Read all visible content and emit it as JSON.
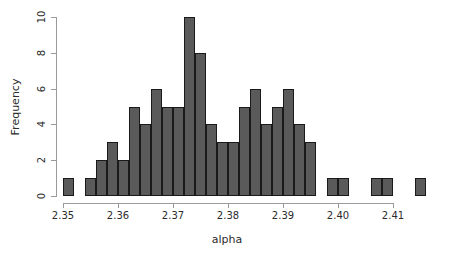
{
  "chart_data": {
    "type": "bar",
    "subtype": "histogram",
    "title": "",
    "xlabel": "alpha",
    "ylabel": "Frequency",
    "xlim": [
      2.3495,
      2.4165
    ],
    "ylim": [
      0,
      10
    ],
    "bin_width": 0.002,
    "grid": false,
    "legend": null,
    "xticks": [
      2.35,
      2.36,
      2.37,
      2.38,
      2.39,
      2.4,
      2.41
    ],
    "xtick_labels": [
      "2.35",
      "2.36",
      "2.37",
      "2.38",
      "2.39",
      "2.40",
      "2.41"
    ],
    "yticks": [
      0,
      2,
      4,
      6,
      8,
      10
    ],
    "ytick_labels": [
      "0",
      "2",
      "4",
      "6",
      "8",
      "10"
    ],
    "bar_fill": "#5a5a5a",
    "bar_edge": "#1a1a1a",
    "axis_color": "#9a9a9a",
    "bins": [
      {
        "x0": 2.35,
        "x1": 2.352,
        "count": 1
      },
      {
        "x0": 2.352,
        "x1": 2.354,
        "count": 0
      },
      {
        "x0": 2.354,
        "x1": 2.356,
        "count": 1
      },
      {
        "x0": 2.356,
        "x1": 2.358,
        "count": 2
      },
      {
        "x0": 2.358,
        "x1": 2.36,
        "count": 3
      },
      {
        "x0": 2.36,
        "x1": 2.362,
        "count": 2
      },
      {
        "x0": 2.362,
        "x1": 2.364,
        "count": 5
      },
      {
        "x0": 2.364,
        "x1": 2.366,
        "count": 4
      },
      {
        "x0": 2.366,
        "x1": 2.368,
        "count": 6
      },
      {
        "x0": 2.368,
        "x1": 2.37,
        "count": 5
      },
      {
        "x0": 2.37,
        "x1": 2.372,
        "count": 5
      },
      {
        "x0": 2.372,
        "x1": 2.374,
        "count": 10
      },
      {
        "x0": 2.374,
        "x1": 2.376,
        "count": 8
      },
      {
        "x0": 2.376,
        "x1": 2.378,
        "count": 4
      },
      {
        "x0": 2.378,
        "x1": 2.38,
        "count": 3
      },
      {
        "x0": 2.38,
        "x1": 2.382,
        "count": 3
      },
      {
        "x0": 2.382,
        "x1": 2.384,
        "count": 5
      },
      {
        "x0": 2.384,
        "x1": 2.386,
        "count": 6
      },
      {
        "x0": 2.386,
        "x1": 2.388,
        "count": 4
      },
      {
        "x0": 2.388,
        "x1": 2.39,
        "count": 5
      },
      {
        "x0": 2.39,
        "x1": 2.392,
        "count": 6
      },
      {
        "x0": 2.392,
        "x1": 2.394,
        "count": 4
      },
      {
        "x0": 2.394,
        "x1": 2.396,
        "count": 3
      },
      {
        "x0": 2.396,
        "x1": 2.398,
        "count": 0
      },
      {
        "x0": 2.398,
        "x1": 2.4,
        "count": 1
      },
      {
        "x0": 2.4,
        "x1": 2.402,
        "count": 1
      },
      {
        "x0": 2.402,
        "x1": 2.404,
        "count": 0
      },
      {
        "x0": 2.404,
        "x1": 2.406,
        "count": 0
      },
      {
        "x0": 2.406,
        "x1": 2.408,
        "count": 1
      },
      {
        "x0": 2.408,
        "x1": 2.41,
        "count": 1
      },
      {
        "x0": 2.41,
        "x1": 2.412,
        "count": 0
      },
      {
        "x0": 2.412,
        "x1": 2.414,
        "count": 0
      },
      {
        "x0": 2.414,
        "x1": 2.416,
        "count": 1
      }
    ]
  }
}
